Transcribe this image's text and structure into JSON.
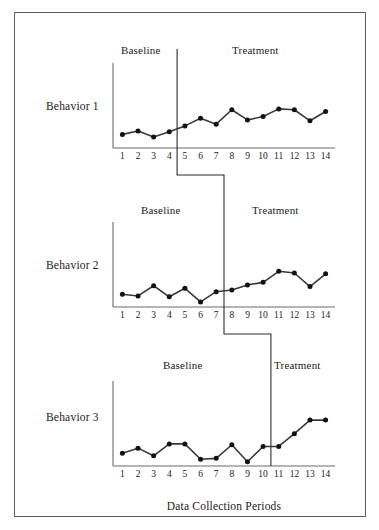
{
  "figure": {
    "xaxis_title": "Data Collection Periods",
    "frame_color": "#5e5e5e",
    "line_color": "#3a3a3a",
    "marker_color": "#121212",
    "axis_color": "#6b6b6b"
  },
  "chart_data": {
    "type": "line",
    "title": "",
    "subtitle": "",
    "xlabel": "Data Collection Periods",
    "ylabel": "",
    "grid": false,
    "legend": "none",
    "design": "multiple-baseline",
    "x": [
      1,
      2,
      3,
      4,
      5,
      6,
      7,
      8,
      9,
      10,
      11,
      12,
      13,
      14
    ],
    "xlim": [
      0.4,
      14.6
    ],
    "ylim": [
      0,
      10
    ],
    "tick_labels": [
      "1",
      "2",
      "3",
      "4",
      "5",
      "6",
      "7",
      "8",
      "9",
      "10",
      "11",
      "12",
      "13",
      "14"
    ],
    "panels": [
      {
        "name": "Behavior 1",
        "label": "Behavior 1",
        "phase_change_after": 4,
        "phases": [
          {
            "label": "Baseline",
            "start": 1,
            "end": 4
          },
          {
            "label": "Treatment",
            "start": 5,
            "end": 14
          }
        ],
        "values": [
          1.6,
          2.0,
          1.3,
          1.9,
          2.6,
          3.5,
          2.8,
          4.5,
          3.3,
          3.7,
          4.6,
          4.5,
          3.2,
          4.3
        ]
      },
      {
        "name": "Behavior 2",
        "label": "Behavior 2",
        "phase_change_after": 7,
        "phases": [
          {
            "label": "Baseline",
            "start": 1,
            "end": 7
          },
          {
            "label": "Treatment",
            "start": 8,
            "end": 14
          }
        ],
        "values": [
          1.5,
          1.3,
          2.5,
          1.2,
          2.2,
          0.6,
          1.8,
          2.0,
          2.6,
          2.9,
          4.2,
          4.0,
          2.4,
          3.9
        ]
      },
      {
        "name": "Behavior 3",
        "label": "Behavior 3",
        "phase_change_after": 10,
        "phases": [
          {
            "label": "Baseline",
            "start": 1,
            "end": 10
          },
          {
            "label": "Treatment",
            "start": 11,
            "end": 14
          }
        ],
        "values": [
          1.5,
          2.1,
          1.2,
          2.6,
          2.6,
          0.8,
          0.9,
          2.5,
          0.5,
          2.3,
          2.3,
          3.8,
          5.4,
          5.4
        ]
      }
    ]
  },
  "panel_labels": {
    "behavior_1": "Behavior 1",
    "behavior_2": "Behavior 2",
    "behavior_3": "Behavior 3"
  },
  "phase_labels": {
    "p1_baseline": "Baseline",
    "p1_treatment": "Treatment",
    "p2_baseline": "Baseline",
    "p2_treatment": "Treatment",
    "p3_baseline": "Baseline",
    "p3_treatment": "Treatment"
  }
}
